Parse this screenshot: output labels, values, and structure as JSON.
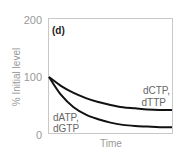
{
  "panel_label": "(d)",
  "chart_data": {
    "type": "line",
    "title": "",
    "xlabel": "Time",
    "ylabel": "% Initial level",
    "ylim": [
      0,
      200
    ],
    "yticks": [
      0,
      100,
      200
    ],
    "ytick_labels": [
      "0",
      "100",
      "200"
    ],
    "grid": false,
    "legend": "inline labels",
    "x": [
      0,
      0.1,
      0.2,
      0.3,
      0.4,
      0.5,
      0.6,
      0.7,
      0.8,
      0.9,
      1.0
    ],
    "series": [
      {
        "name": "dCTP, dTTP",
        "label_line1": "dCTP,",
        "label_line2": "dTTP",
        "values": [
          100,
          84,
          72,
          63,
          56,
          51,
          47,
          45,
          43,
          42,
          42
        ]
      },
      {
        "name": "dATP, dGTP",
        "label_line1": "dATP,",
        "label_line2": "dGTP",
        "values": [
          100,
          68,
          47,
          34,
          26,
          20,
          16,
          14,
          13,
          12,
          12
        ]
      }
    ]
  }
}
